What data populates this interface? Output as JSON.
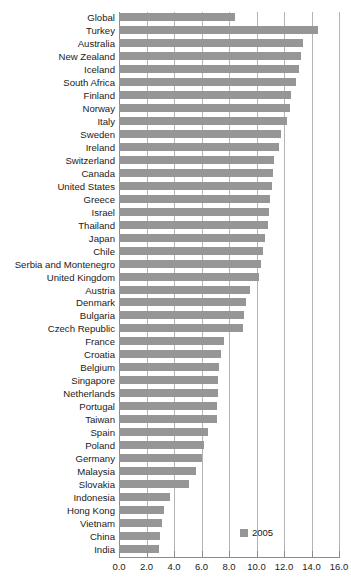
{
  "chart_data": {
    "type": "bar",
    "orientation": "horizontal",
    "title": "",
    "subtitle": "",
    "xlabel": "",
    "ylabel": "",
    "xlim": [
      0.0,
      16.0
    ],
    "xticks": [
      "0.0",
      "2.0",
      "4.0",
      "6.0",
      "8.0",
      "10.0",
      "12.0",
      "14.0",
      "16.0"
    ],
    "xtick_values": [
      0,
      2,
      4,
      6,
      8,
      10,
      12,
      14,
      16
    ],
    "grid": "vertical",
    "legend_position": "bottom-right",
    "legend": [
      "2005"
    ],
    "bar_color": "#969696",
    "grid_color": "#b4b4b4",
    "axis_color": "#8c8c8c",
    "categories": [
      "Global",
      "Turkey",
      "Australia",
      "New Zealand",
      "Iceland",
      "South Africa",
      "Finland",
      "Norway",
      "Italy",
      "Sweden",
      "Ireland",
      "Switzerland",
      "Canada",
      "United States",
      "Greece",
      "Israel",
      "Thailand",
      "Japan",
      "Chile",
      "Serbia and Montenegro",
      "United Kingdom",
      "Austria",
      "Denmark",
      "Bulgaria",
      "Czech Republic",
      "France",
      "Croatia",
      "Belgium",
      "Singapore",
      "Netherlands",
      "Portugal",
      "Taiwan",
      "Spain",
      "Poland",
      "Germany",
      "Malaysia",
      "Slovakia",
      "Indonesia",
      "Hong Kong",
      "Vietnam",
      "China",
      "India"
    ],
    "series": [
      {
        "name": "2005",
        "values": [
          8.4,
          14.5,
          13.4,
          13.2,
          13.1,
          12.9,
          12.5,
          12.4,
          12.2,
          11.8,
          11.6,
          11.3,
          11.2,
          11.1,
          11.0,
          10.9,
          10.8,
          10.6,
          10.5,
          10.3,
          10.2,
          9.5,
          9.2,
          9.1,
          9.0,
          7.6,
          7.4,
          7.3,
          7.2,
          7.2,
          7.1,
          7.1,
          6.5,
          6.2,
          6.0,
          5.6,
          5.1,
          3.7,
          3.3,
          3.1,
          3.0,
          2.9
        ]
      }
    ]
  },
  "legend": {
    "label": "2005",
    "swatch_name": "legend-swatch-2005"
  }
}
